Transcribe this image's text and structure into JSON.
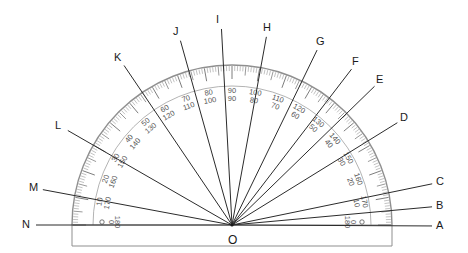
{
  "figure": {
    "type": "protractor-diagram",
    "vertex": {
      "label": "O",
      "x": 232,
      "y": 225
    },
    "colors": {
      "ink": "#1a1a1a",
      "ray": "#2b2b2b",
      "body_edge": "#8f8f8f",
      "tick": "#6e6e6e",
      "scale_text": "#555555",
      "background": "#ffffff"
    },
    "body": {
      "outer_radius": 160,
      "inner_radius": 139,
      "base_left_x": 72,
      "base_right_x": 392,
      "base_top_y": 225,
      "base_bottom_y": 246,
      "endpoint_zero_labels": [
        "0",
        "180"
      ]
    }
  },
  "rays": [
    {
      "id": "A",
      "label": "A",
      "angle_deg": 0,
      "label_x": 436,
      "label_y": 220
    },
    {
      "id": "B",
      "label": "B",
      "angle_deg": 8,
      "label_x": 436,
      "label_y": 200
    },
    {
      "id": "C",
      "label": "C",
      "angle_deg": 16,
      "label_x": 436,
      "label_y": 176
    },
    {
      "id": "D",
      "label": "D",
      "angle_deg": 30,
      "label_x": 400,
      "label_y": 112
    },
    {
      "id": "E",
      "label": "E",
      "angle_deg": 42,
      "label_x": 376,
      "label_y": 74
    },
    {
      "id": "F",
      "label": "F",
      "angle_deg": 51,
      "label_x": 352,
      "label_y": 56
    },
    {
      "id": "G",
      "label": "G",
      "angle_deg": 60,
      "label_x": 316,
      "label_y": 36
    },
    {
      "id": "H",
      "label": "H",
      "angle_deg": 78,
      "label_x": 263,
      "label_y": 22
    },
    {
      "id": "I",
      "label": "I",
      "angle_deg": 93,
      "label_x": 216,
      "label_y": 14
    },
    {
      "id": "J",
      "label": "J",
      "angle_deg": 107,
      "label_x": 173,
      "label_y": 26
    },
    {
      "id": "K",
      "label": "K",
      "angle_deg": 128,
      "label_x": 114,
      "label_y": 52
    },
    {
      "id": "L",
      "label": "L",
      "angle_deg": 150,
      "label_x": 55,
      "label_y": 120
    },
    {
      "id": "M",
      "label": "M",
      "angle_deg": 168,
      "label_x": 29,
      "label_y": 182
    },
    {
      "id": "N",
      "label": "N",
      "angle_deg": 180,
      "label_x": 22,
      "label_y": 219
    }
  ],
  "scale": {
    "description": "Dual scale: outer numbers increase clockwise, inner numbers increase counter-clockwise",
    "major_labels": [
      {
        "angle_deg": 10,
        "outer": "170",
        "inner": "10"
      },
      {
        "angle_deg": 20,
        "outer": "160",
        "inner": "20"
      },
      {
        "angle_deg": 30,
        "outer": "150",
        "inner": "30"
      },
      {
        "angle_deg": 40,
        "outer": "140",
        "inner": "40"
      },
      {
        "angle_deg": 50,
        "outer": "130",
        "inner": "50"
      },
      {
        "angle_deg": 60,
        "outer": "120",
        "inner": "60"
      },
      {
        "angle_deg": 70,
        "outer": "110",
        "inner": "70"
      },
      {
        "angle_deg": 80,
        "outer": "100",
        "inner": "80"
      },
      {
        "angle_deg": 90,
        "outer": "90",
        "inner": "90"
      },
      {
        "angle_deg": 100,
        "outer": "80",
        "inner": "100"
      },
      {
        "angle_deg": 110,
        "outer": "70",
        "inner": "110"
      },
      {
        "angle_deg": 120,
        "outer": "60",
        "inner": "120"
      },
      {
        "angle_deg": 130,
        "outer": "50",
        "inner": "130"
      },
      {
        "angle_deg": 140,
        "outer": "40",
        "inner": "140"
      },
      {
        "angle_deg": 150,
        "outer": "30",
        "inner": "150"
      },
      {
        "angle_deg": 160,
        "outer": "20",
        "inner": "160"
      },
      {
        "angle_deg": 170,
        "outer": "10",
        "inner": "170"
      }
    ]
  }
}
